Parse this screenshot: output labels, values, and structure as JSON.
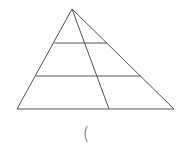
{
  "diagram": {
    "type": "triangle-with-parallel-lines",
    "stroke_color": "#555555",
    "background_color": "#ffffff",
    "triangle": {
      "apex": [
        72,
        9
      ],
      "base_left": [
        17,
        109
      ],
      "base_right": [
        174,
        109
      ]
    },
    "horizontal_lines": [
      {
        "y": 43,
        "x1": 54,
        "x2": 107
      },
      {
        "y": 76,
        "x1": 36,
        "x2": 141
      }
    ],
    "cevian": {
      "from": [
        72,
        9
      ],
      "to": [
        109,
        109
      ]
    }
  },
  "caption": {
    "text": "("
  }
}
